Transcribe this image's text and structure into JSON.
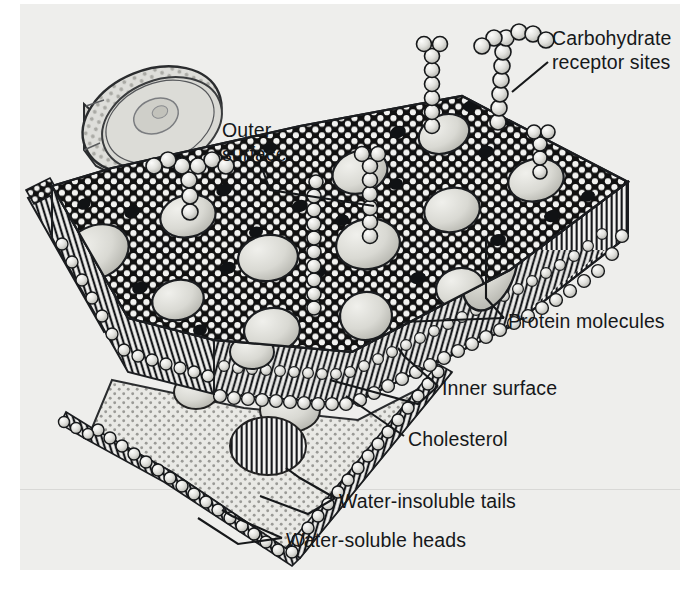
{
  "figure": {
    "background_color": "#eeeeec",
    "ink_color": "#16181a"
  },
  "labels": [
    {
      "id": "carbohydrate-receptor-sites",
      "text": "Carbohydrate\nreceptor sites",
      "line1": "Carbohydrate",
      "line2": "receptor sites",
      "x": 552,
      "y": 26
    },
    {
      "id": "outer-surface",
      "text": "Outer\nsurface",
      "line1": "Outer",
      "line2": "surface",
      "x": 222,
      "y": 118
    },
    {
      "id": "protein-molecules",
      "text": "Protein molecules",
      "x": 508,
      "y": 322
    },
    {
      "id": "inner-surface",
      "text": "Inner surface",
      "x": 442,
      "y": 389
    },
    {
      "id": "cholesterol",
      "text": "Cholesterol",
      "x": 408,
      "y": 440
    },
    {
      "id": "water-insoluble-tails",
      "text": "Water-insoluble tails",
      "x": 339,
      "y": 502
    },
    {
      "id": "water-soluble-heads",
      "text": "Water-soluble heads",
      "x": 286,
      "y": 541
    }
  ],
  "leader_lines": [
    {
      "id": "leader-carbohydrate",
      "points": "548,62 512,92"
    },
    {
      "id": "leader-outer-surface",
      "points": "262,168 270,188 372,206"
    },
    {
      "id": "leader-protein-right",
      "points": "504,318 486,300 486,234"
    },
    {
      "id": "leader-protein-left",
      "points": "504,318 400,322"
    },
    {
      "id": "leader-inner-1",
      "points": "438,386 404,358 398,350"
    },
    {
      "id": "leader-inner-2",
      "points": "438,386 420,404 330,380"
    },
    {
      "id": "leader-cholesterol",
      "points": "404,436 346,398"
    },
    {
      "id": "leader-tails-1",
      "points": "335,498 300,480 286,470"
    },
    {
      "id": "leader-tails-2",
      "points": "335,498 310,514 262,498"
    },
    {
      "id": "leader-heads-1",
      "points": "282,538 232,518 224,512"
    },
    {
      "id": "leader-heads-2",
      "points": "282,538 240,544 200,520"
    }
  ],
  "membrane": {
    "outer_surface_name": "phospholipid-head-mosaic",
    "inner_surface_name": "stippled-inner-surface",
    "tail_layer_name": "hatched-water-insoluble-tails",
    "head_circle_count_note": "dense mosaic of small spheres",
    "protein_blob_count": 14,
    "cholesterol_dot_count": 22,
    "carbohydrate_chain_count": 6
  },
  "inset_cell": {
    "name": "cell-inset-illustration",
    "nucleus_name": "nucleus"
  }
}
